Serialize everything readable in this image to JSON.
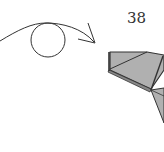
{
  "diagram": {
    "step_number": "38",
    "instruction_symbol": "turn-over-arrow",
    "colors": {
      "paper_fill": "#b0b0b0",
      "stroke": "#333333",
      "background": "#ffffff"
    }
  }
}
